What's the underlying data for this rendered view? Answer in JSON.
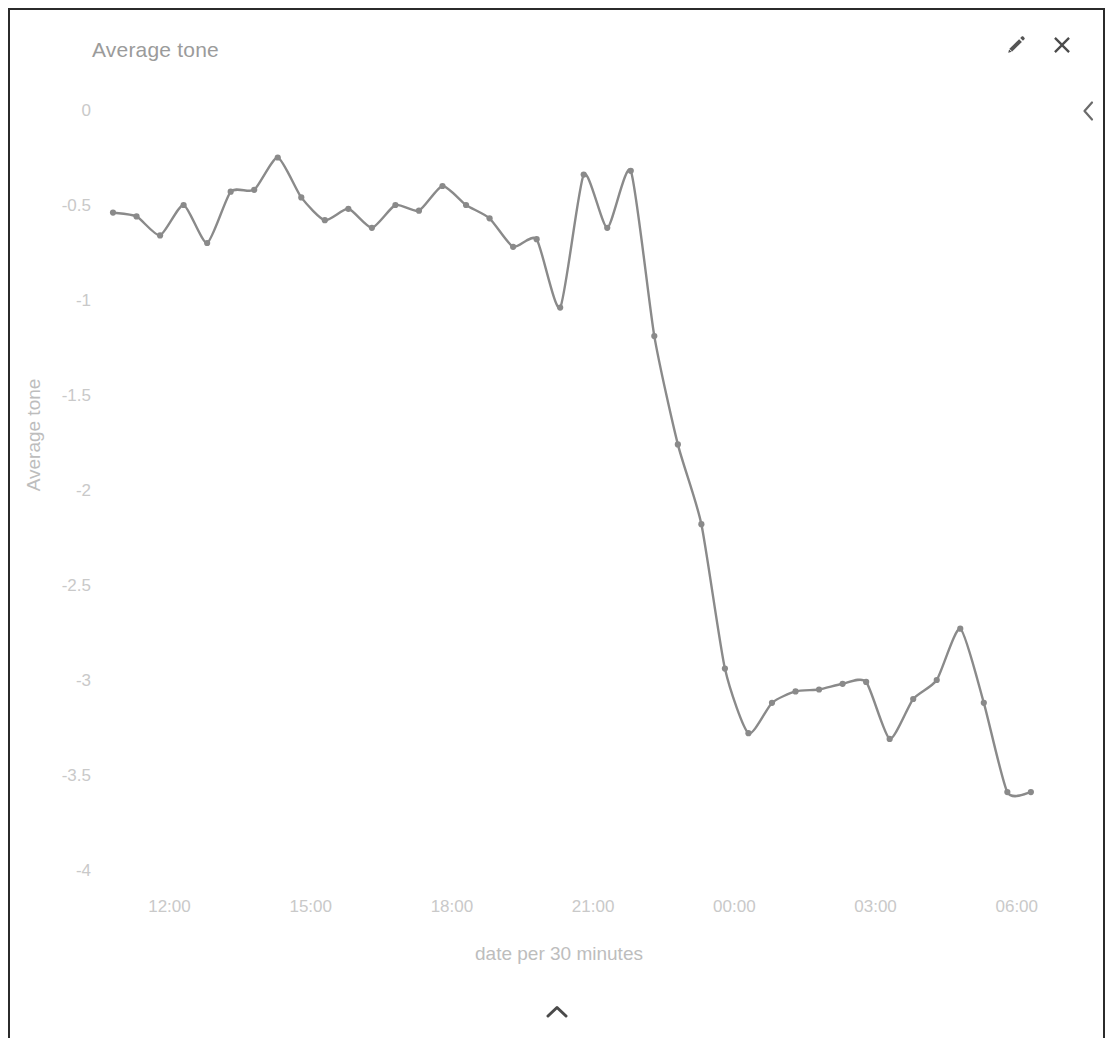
{
  "panel": {
    "title": "Average tone",
    "accent_color": "#8a8a8a",
    "label_color": "#c9c9c9",
    "border_color": "#2b2b2b"
  },
  "header": {
    "edit_icon": "pencil-icon",
    "close_icon": "close-icon",
    "collapse_left_icon": "chevron-left-icon",
    "collapse_up_icon": "chevron-up-icon"
  },
  "chart_data": {
    "type": "line",
    "title": "Average tone",
    "xlabel": "date per 30 minutes",
    "ylabel": "Average tone",
    "ylim": [
      -4,
      0
    ],
    "yticks": [
      0,
      -0.5,
      -1,
      -1.5,
      -2,
      -2.5,
      -3,
      -3.5,
      -4
    ],
    "ytick_labels": [
      "0",
      "-0.5",
      "-1",
      "-1.5",
      "-2",
      "-2.5",
      "-3",
      "-3.5",
      "-4"
    ],
    "xticks": [
      "12:00",
      "15:00",
      "18:00",
      "21:00",
      "00:00",
      "03:00",
      "06:00"
    ],
    "xtick_hours": [
      12,
      15,
      18,
      21,
      24,
      27,
      30
    ],
    "x_range_hours": [
      10.8,
      30.6
    ],
    "grid": false,
    "legend": false,
    "markers": true,
    "x": [
      10.8,
      11.3,
      11.8,
      12.3,
      12.8,
      13.3,
      13.8,
      14.3,
      14.8,
      15.3,
      15.8,
      16.3,
      16.8,
      17.3,
      17.8,
      18.3,
      18.8,
      19.3,
      19.8,
      20.3,
      20.8,
      21.3,
      21.8,
      22.3,
      22.8,
      23.3,
      23.8,
      24.3,
      24.8,
      25.3,
      25.8,
      26.3,
      26.8,
      27.3,
      27.8,
      28.3,
      28.8,
      29.3,
      29.8,
      30.3
    ],
    "x_labels": [
      "10:48",
      "11:18",
      "11:48",
      "12:18",
      "12:48",
      "13:18",
      "13:48",
      "14:18",
      "14:48",
      "15:18",
      "15:48",
      "16:18",
      "16:48",
      "17:18",
      "17:48",
      "18:18",
      "18:48",
      "19:18",
      "19:48",
      "20:18",
      "20:48",
      "21:18",
      "21:48",
      "22:18",
      "22:48",
      "23:18",
      "23:48",
      "00:18",
      "00:48",
      "01:18",
      "01:48",
      "02:18",
      "02:48",
      "03:18",
      "03:48",
      "04:18",
      "04:48",
      "05:18",
      "05:48",
      "06:18"
    ],
    "values": [
      -0.54,
      -0.56,
      -0.66,
      -0.5,
      -0.7,
      -0.43,
      -0.42,
      -0.25,
      -0.46,
      -0.58,
      -0.52,
      -0.62,
      -0.5,
      -0.53,
      -0.4,
      -0.5,
      -0.57,
      -0.72,
      -0.68,
      -1.04,
      -0.34,
      -0.62,
      -0.32,
      -1.19,
      -1.76,
      -2.18,
      -2.94,
      -3.28,
      -3.12,
      -3.06,
      -3.05,
      -3.02,
      -3.01,
      -3.31,
      -3.1,
      -3.0,
      -2.73,
      -3.12,
      -3.59,
      -3.59
    ],
    "series": [
      {
        "name": "Average tone",
        "color": "#8a8a8a",
        "values": [
          -0.54,
          -0.56,
          -0.66,
          -0.5,
          -0.7,
          -0.43,
          -0.42,
          -0.25,
          -0.46,
          -0.58,
          -0.52,
          -0.62,
          -0.5,
          -0.53,
          -0.4,
          -0.5,
          -0.57,
          -0.72,
          -0.68,
          -1.04,
          -0.34,
          -0.62,
          -0.32,
          -1.19,
          -1.76,
          -2.18,
          -2.94,
          -3.28,
          -3.12,
          -3.06,
          -3.05,
          -3.02,
          -3.01,
          -3.31,
          -3.1,
          -3.0,
          -2.73,
          -3.12,
          -3.59,
          -3.59
        ]
      }
    ]
  }
}
